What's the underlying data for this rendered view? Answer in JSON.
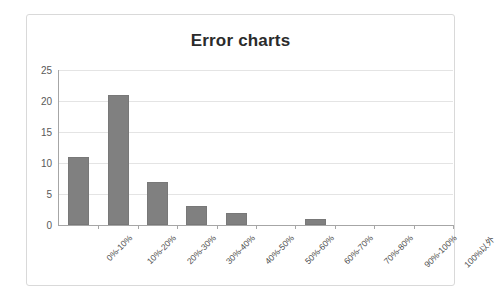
{
  "chart_data": {
    "type": "bar",
    "title": "Error charts",
    "xlabel": "",
    "ylabel": "",
    "categories": [
      "0%-10%",
      "10%-20%",
      "20%-30%",
      "30%-40%",
      "40%-50%",
      "50%-60%",
      "60%-70%",
      "70%-80%",
      "90%-100%",
      "100%以外"
    ],
    "values": [
      11,
      21,
      7,
      3,
      2,
      0,
      1,
      0,
      0,
      0
    ],
    "ylim": [
      0,
      25
    ],
    "yticks": [
      0,
      5,
      10,
      15,
      20,
      25
    ],
    "ytick_labels": [
      "0",
      "5",
      "10",
      "15",
      "20",
      "25"
    ],
    "grid": true,
    "legend": false,
    "bar_color": "#808080"
  },
  "style": {
    "frame_border_color": "#d9d9d9",
    "gridline_color": "#e4e4e4",
    "axis_color": "#a6a6a6",
    "title_color": "#2b2b2b",
    "tick_label_color": "#595959"
  }
}
